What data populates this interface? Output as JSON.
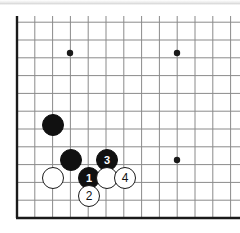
{
  "diagram": {
    "board_region": "bottom-left corner",
    "background_color": "#ffffff",
    "line_color": "#8a8a8a",
    "edge_color": "#1a1a1a",
    "black_color": "#111111",
    "white_color": "#ffffff"
  },
  "board": {
    "origin_x": 17,
    "origin_y": 218,
    "spacing": 17.8,
    "columns": 13,
    "rows": 12,
    "star_points": [
      {
        "name": "star-point-upper-left",
        "x": 70,
        "y": 53
      },
      {
        "name": "star-point-upper-right",
        "x": 177,
        "y": 53
      },
      {
        "name": "star-point-lower-right",
        "x": 177,
        "y": 160
      }
    ]
  },
  "stones": [
    {
      "id": "black-stone-a",
      "color": "black",
      "label": "",
      "x": 53,
      "y": 125,
      "r": 11
    },
    {
      "id": "black-stone-b",
      "color": "black",
      "label": "",
      "x": 71,
      "y": 160,
      "r": 11
    },
    {
      "id": "white-stone-a",
      "color": "white",
      "label": "",
      "x": 53,
      "y": 178,
      "r": 11
    },
    {
      "id": "black-move-1",
      "color": "black",
      "label": "1",
      "x": 89,
      "y": 178,
      "r": 11
    },
    {
      "id": "white-move-2",
      "color": "white",
      "label": "2",
      "x": 89,
      "y": 196,
      "r": 11
    },
    {
      "id": "black-move-3",
      "color": "black",
      "label": "3",
      "x": 107,
      "y": 160,
      "r": 11
    },
    {
      "id": "white-stone-b",
      "color": "white",
      "label": "",
      "x": 107,
      "y": 178,
      "r": 11
    },
    {
      "id": "white-move-4",
      "color": "white",
      "label": "4",
      "x": 125,
      "y": 178,
      "r": 11
    }
  ],
  "move_sequence": {
    "moves": [
      {
        "number": "1",
        "color": "black"
      },
      {
        "number": "2",
        "color": "white"
      },
      {
        "number": "3",
        "color": "black"
      },
      {
        "number": "4",
        "color": "white"
      }
    ]
  }
}
